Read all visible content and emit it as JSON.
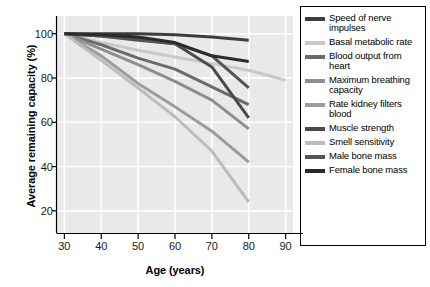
{
  "chart_data": {
    "type": "line",
    "title": "",
    "xlabel": "Age (years)",
    "ylabel": "Average remaining capacity (%)",
    "xlim": [
      28,
      92
    ],
    "ylim": [
      10,
      108
    ],
    "xticks": [
      30,
      40,
      50,
      60,
      70,
      80,
      90
    ],
    "yticks": [
      20,
      40,
      60,
      80,
      100
    ],
    "grid": true,
    "grid_color": "#ffffff",
    "plot_background": "#e9e9e9",
    "legend_position": "right",
    "x": [
      30,
      40,
      50,
      60,
      70,
      80
    ],
    "series": [
      {
        "name": "Speed of nerve impulses",
        "color": "#3d3d3d",
        "x": [
          30,
          40,
          50,
          60,
          70,
          80
        ],
        "values": [
          100,
          100,
          100,
          99.5,
          98.5,
          97
        ]
      },
      {
        "name": "Basal metabolic rate",
        "color": "#c9c9c9",
        "x": [
          30,
          40,
          50,
          60,
          70,
          80,
          90
        ],
        "values": [
          100,
          96,
          92.5,
          89.5,
          86.5,
          83.5,
          79
        ]
      },
      {
        "name": "Blood output from heart",
        "color": "#6b6b6b",
        "x": [
          30,
          40,
          50,
          60,
          70,
          80
        ],
        "values": [
          100,
          95,
          89,
          84,
          76,
          68
        ]
      },
      {
        "name": "Maximum breathing capacity",
        "color": "#8e8e8e",
        "x": [
          30,
          40,
          50,
          60,
          70,
          80
        ],
        "values": [
          100,
          93,
          86,
          78.5,
          70,
          57
        ]
      },
      {
        "name": "Rate kidney filters blood",
        "color": "#9c9c9c",
        "x": [
          30,
          40,
          50,
          60,
          70,
          80
        ],
        "values": [
          100,
          90,
          77.5,
          67,
          56,
          42
        ]
      },
      {
        "name": "Muscle strength",
        "color": "#4a4a4a",
        "x": [
          30,
          40,
          50,
          60,
          70,
          80
        ],
        "values": [
          100,
          99,
          97.5,
          95.5,
          85,
          62
        ]
      },
      {
        "name": "Smell sensitivity",
        "color": "#bdbdbd",
        "x": [
          30,
          40,
          50,
          60,
          70,
          80
        ],
        "values": [
          100,
          88,
          75.5,
          62.5,
          47,
          24
        ]
      },
      {
        "name": "Male bone mass",
        "color": "#545454",
        "x": [
          30,
          40,
          50,
          60,
          70,
          80
        ],
        "values": [
          100,
          99,
          97,
          95.5,
          90,
          75.5
        ]
      },
      {
        "name": "Female bone mass",
        "color": "#2b2b2b",
        "x": [
          30,
          40,
          50,
          60,
          70,
          80
        ],
        "values": [
          100,
          99.5,
          98.5,
          96,
          90,
          87.5
        ]
      }
    ]
  },
  "legend": {
    "items": [
      {
        "label": "Speed of nerve impulses",
        "color": "#3d3d3d"
      },
      {
        "label": "Basal metabolic rate",
        "color": "#c9c9c9"
      },
      {
        "label": "Blood output from heart",
        "color": "#6b6b6b"
      },
      {
        "label": "Maximum breathing capacity",
        "color": "#8e8e8e"
      },
      {
        "label": "Rate kidney filters blood",
        "color": "#9c9c9c"
      },
      {
        "label": "Muscle strength",
        "color": "#4a4a4a"
      },
      {
        "label": "Smell sensitivity",
        "color": "#bdbdbd"
      },
      {
        "label": "Male bone mass",
        "color": "#545454"
      },
      {
        "label": "Female bone mass",
        "color": "#2b2b2b"
      }
    ]
  }
}
